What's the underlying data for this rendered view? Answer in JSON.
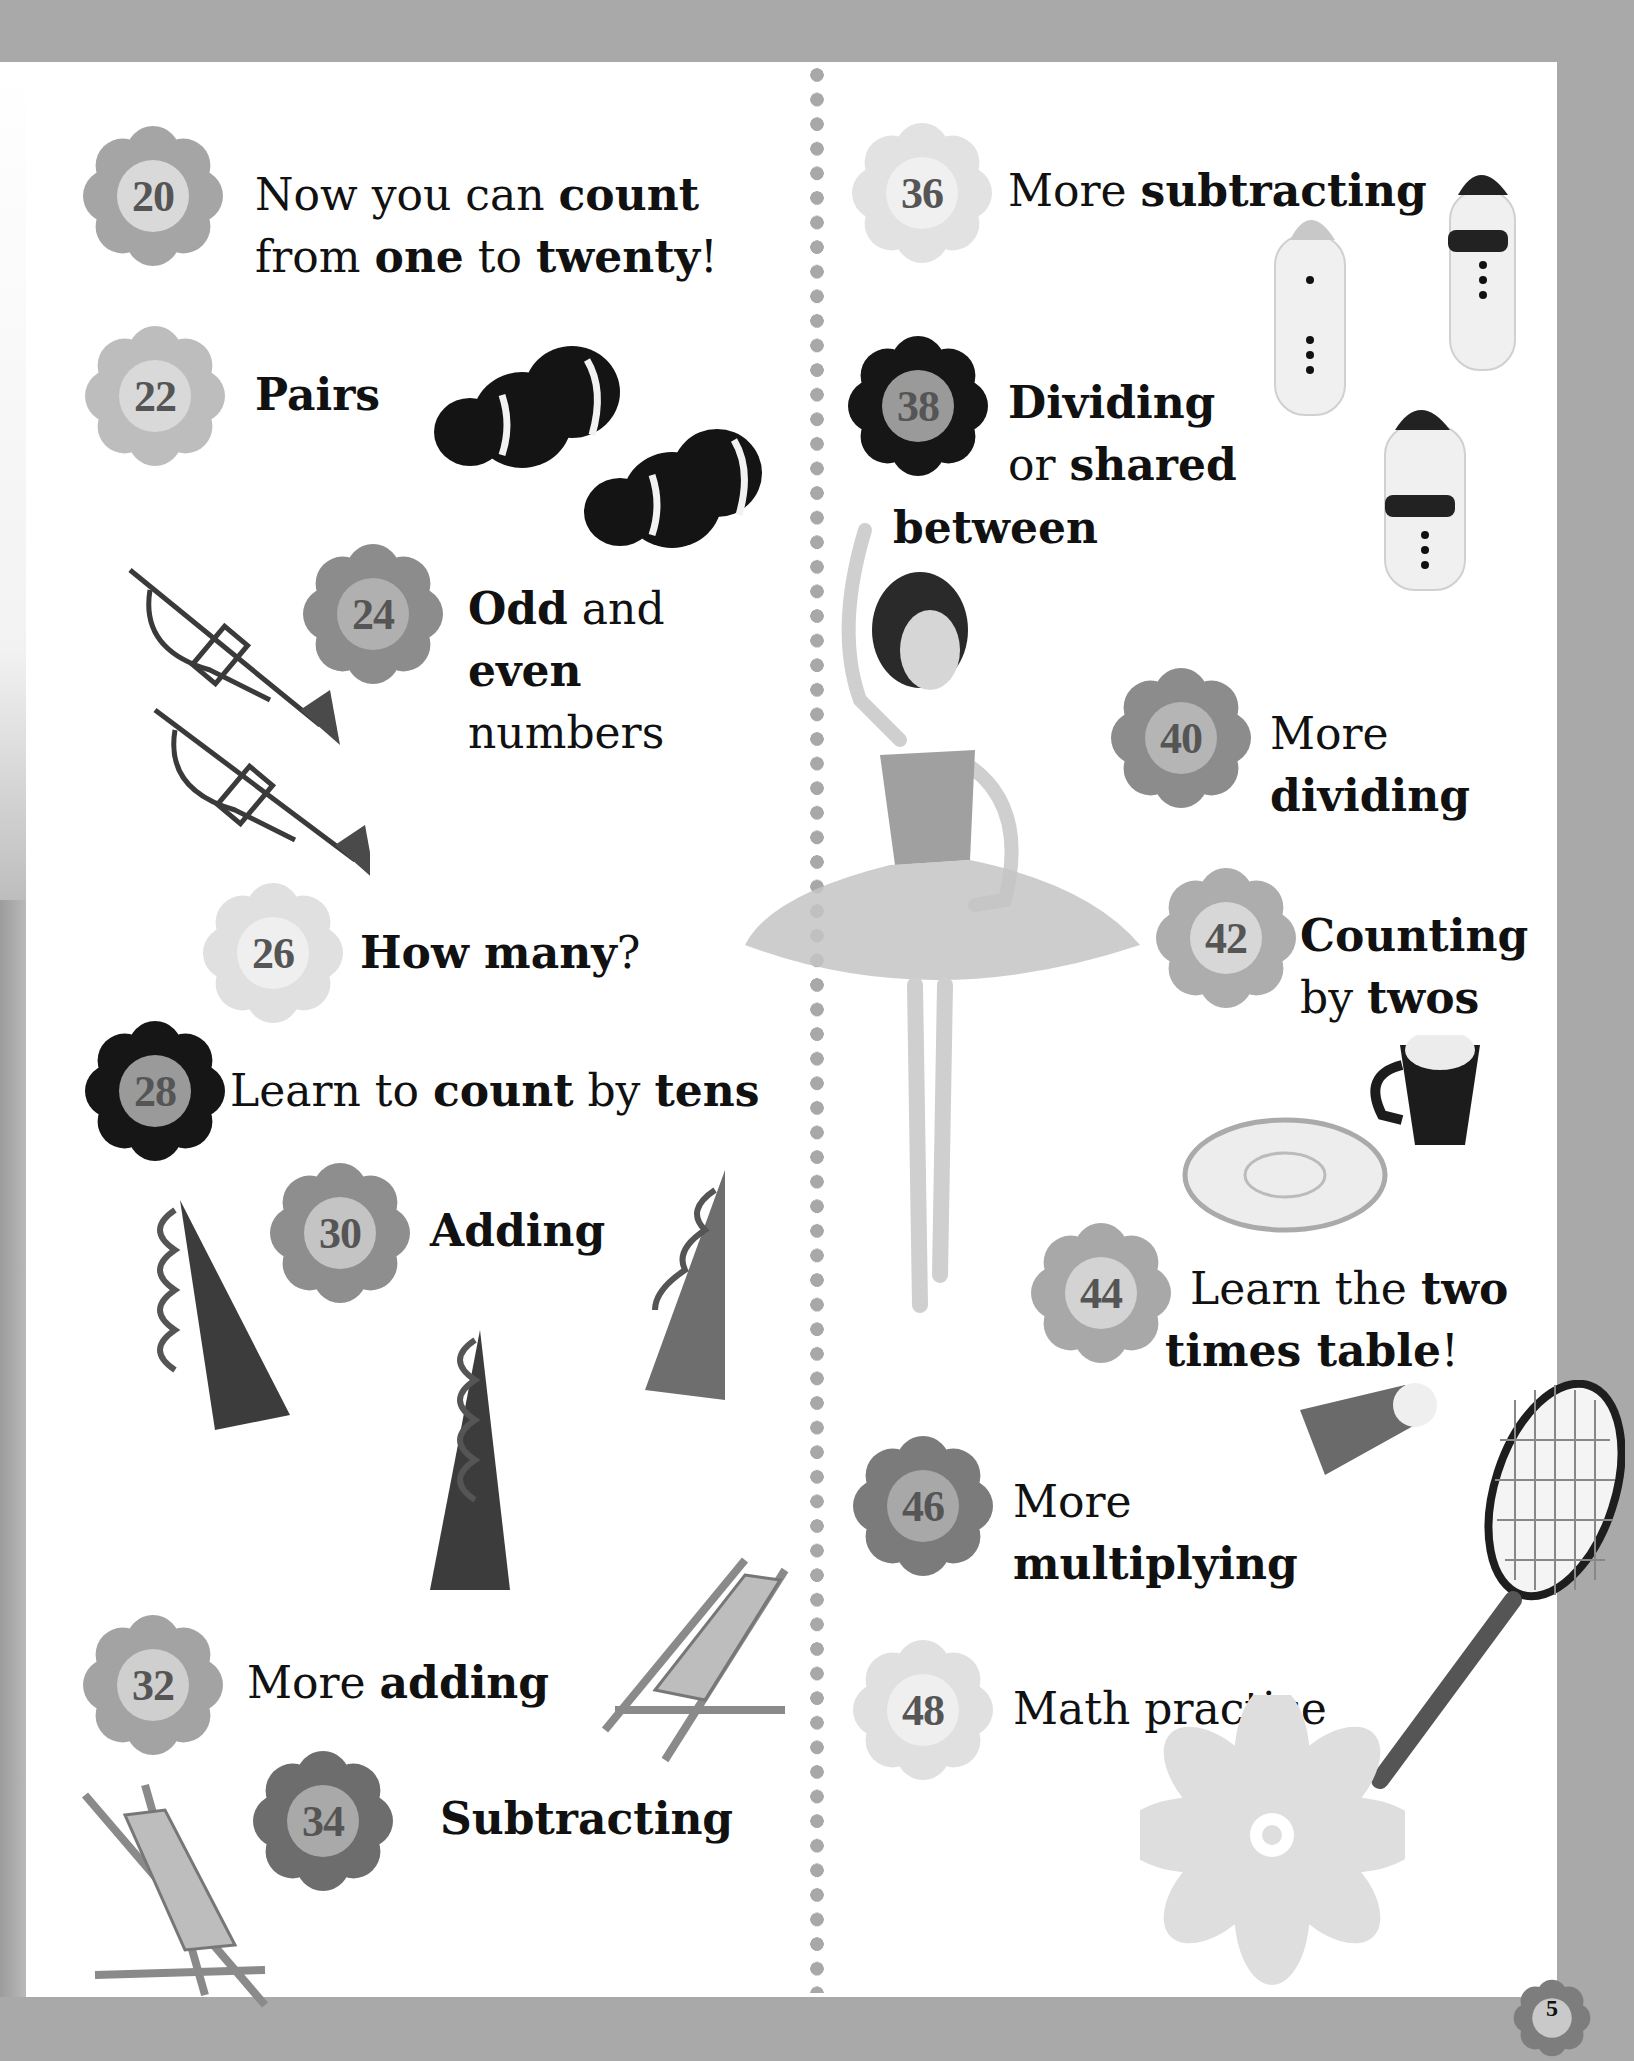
{
  "page": {
    "number": "5"
  },
  "colors": {
    "background_border": "#a9a9a9",
    "page": "#ffffff",
    "divider_dots": "#a8a8a8",
    "flower_light": "#d7d7d7",
    "flower_mid": "#a5a5a5",
    "flower_midDark": "#8c8c8c",
    "flower_dark": "#161616",
    "flower_center_light": "#ededed",
    "flower_center_mid": "#cfcfcf",
    "flower_center_dark": "#9a9a9a"
  },
  "left_column": [
    {
      "page": "20",
      "parts": [
        [
          "Now you can ",
          "reg"
        ],
        [
          "count",
          "b"
        ]
      ],
      "line2": [
        [
          "from ",
          "reg"
        ],
        [
          "one",
          "b"
        ],
        [
          " to ",
          "reg"
        ],
        [
          "twenty",
          "b"
        ],
        [
          "!",
          "reg"
        ]
      ]
    },
    {
      "page": "22",
      "parts": [
        [
          "Pairs",
          "b"
        ]
      ]
    },
    {
      "page": "24",
      "parts": [
        [
          "Odd",
          "b"
        ],
        [
          " and",
          "reg"
        ]
      ],
      "line2": [
        [
          "even",
          "b"
        ]
      ],
      "line3": [
        [
          "numbers",
          "reg"
        ]
      ]
    },
    {
      "page": "26",
      "parts": [
        [
          "How many",
          "b"
        ],
        [
          "?",
          "reg"
        ]
      ]
    },
    {
      "page": "28",
      "parts": [
        [
          "Learn to ",
          "reg"
        ],
        [
          "count",
          "b"
        ],
        [
          " by ",
          "reg"
        ],
        [
          "tens",
          "b"
        ]
      ]
    },
    {
      "page": "30",
      "parts": [
        [
          "Adding",
          "b"
        ]
      ]
    },
    {
      "page": "32",
      "parts": [
        [
          "More ",
          "reg"
        ],
        [
          "adding",
          "b"
        ]
      ]
    },
    {
      "page": "34",
      "parts": [
        [
          "Subtracting",
          "b"
        ]
      ]
    }
  ],
  "right_column": [
    {
      "page": "36",
      "parts": [
        [
          "More ",
          "reg"
        ],
        [
          "subtracting",
          "b"
        ]
      ]
    },
    {
      "page": "38",
      "parts": [
        [
          "Dividing",
          "b"
        ]
      ],
      "line2": [
        [
          "or ",
          "reg"
        ],
        [
          "shared",
          "b"
        ]
      ],
      "line3": [
        [
          "between",
          "b"
        ]
      ]
    },
    {
      "page": "40",
      "parts": [
        [
          "More",
          "reg"
        ]
      ],
      "line2": [
        [
          "dividing",
          "b"
        ]
      ]
    },
    {
      "page": "42",
      "parts": [
        [
          "Counting",
          "b"
        ]
      ],
      "line2": [
        [
          "by ",
          "reg"
        ],
        [
          "twos",
          "b"
        ]
      ]
    },
    {
      "page": "44",
      "parts": [
        [
          "Learn the ",
          "reg"
        ],
        [
          "two",
          "b"
        ]
      ],
      "line2": [
        [
          "times table",
          "b"
        ],
        [
          "!",
          "reg"
        ]
      ]
    },
    {
      "page": "46",
      "parts": [
        [
          "More",
          "reg"
        ]
      ],
      "line2": [
        [
          "multiplying",
          "b"
        ]
      ]
    },
    {
      "page": "48",
      "parts": [
        [
          "Math practice",
          "reg"
        ]
      ]
    }
  ],
  "illustrations": [
    "clownfish-pair",
    "trumpet-pair",
    "party-hats",
    "deck-chairs",
    "snowmen",
    "ballerina-doll",
    "teacup-and-saucer",
    "badminton-racket-and-shuttlecock",
    "decorative-daisy"
  ]
}
